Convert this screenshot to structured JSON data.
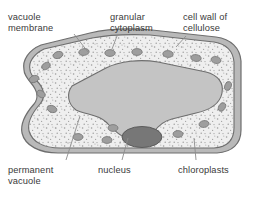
{
  "figure": {
    "width": 255,
    "height": 197,
    "background_color": "#ffffff"
  },
  "labels": {
    "vacuole_membrane": "vacuole\nmembrane",
    "granular_cytoplasm": "granular\ncytoplasm",
    "cell_wall_of_cellulose": "cell wall of\ncellulose",
    "permanent_vacuole": "permanent\nvacuole",
    "nucleus": "nucleus",
    "chloroplasts": "chloroplasts"
  },
  "colors": {
    "text": "#3a3a3a",
    "leader_line": "#8c8c8c",
    "cell_wall_outer_stroke": "#6e6e6e",
    "cell_wall_fill": "#b9b9b9",
    "cell_membrane_stroke": "#6e6e6e",
    "cytoplasm_fill": "#efefef",
    "cytoplasm_speckle": "#9a9a9a",
    "vacuole_fill": "#c4c4c4",
    "vacuole_stroke": "#6e6e6e",
    "chloroplast_fill": "#9e9e9e",
    "chloroplast_stroke": "#767676",
    "nucleus_fill": "#777777",
    "nucleus_stroke": "#5c5c5c"
  },
  "structures": {
    "cell_wall": {
      "name": "cell wall of cellulose",
      "description": "outer double-lined boundary of the cell"
    },
    "cytoplasm": {
      "name": "granular cytoplasm",
      "description": "speckled region between cell wall and vacuole"
    },
    "vacuole": {
      "name": "permanent vacuole",
      "description": "large pale grey central region"
    },
    "nucleus": {
      "name": "nucleus",
      "description": "dark grey ellipse at lower centre",
      "cx": 142,
      "cy": 137,
      "rx": 20,
      "ry": 10.5
    },
    "chloroplasts": {
      "name": "chloroplasts",
      "count": 18,
      "description": "small grey ovals scattered in the cytoplasm",
      "positions": [
        {
          "cx": 58,
          "cy": 55,
          "rx": 5.0,
          "ry": 3.4,
          "rot": -18
        },
        {
          "cx": 84,
          "cy": 52,
          "rx": 5.2,
          "ry": 3.4,
          "rot": -8
        },
        {
          "cx": 110,
          "cy": 53,
          "rx": 5.2,
          "ry": 3.4,
          "rot": 0
        },
        {
          "cx": 137,
          "cy": 52,
          "rx": 5.2,
          "ry": 3.4,
          "rot": 0
        },
        {
          "cx": 168,
          "cy": 54,
          "rx": 5.2,
          "ry": 3.4,
          "rot": 4
        },
        {
          "cx": 196,
          "cy": 58,
          "rx": 5.2,
          "ry": 3.4,
          "rot": 8
        },
        {
          "cx": 216,
          "cy": 60,
          "rx": 5.0,
          "ry": 3.4,
          "rot": 12
        },
        {
          "cx": 46,
          "cy": 66,
          "rx": 4.6,
          "ry": 3.2,
          "rot": -30
        },
        {
          "cx": 34,
          "cy": 79,
          "rx": 5.0,
          "ry": 3.4,
          "rot": -22
        },
        {
          "cx": 41,
          "cy": 94,
          "rx": 4.6,
          "ry": 3.2,
          "rot": 30
        },
        {
          "cx": 52,
          "cy": 109,
          "rx": 5.0,
          "ry": 3.4,
          "rot": 20
        },
        {
          "cx": 228,
          "cy": 86,
          "rx": 4.6,
          "ry": 3.2,
          "rot": -70
        },
        {
          "cx": 222,
          "cy": 107,
          "rx": 4.6,
          "ry": 3.2,
          "rot": -60
        },
        {
          "cx": 204,
          "cy": 124,
          "rx": 5.0,
          "ry": 3.4,
          "rot": -10
        },
        {
          "cx": 178,
          "cy": 134,
          "rx": 5.0,
          "ry": 3.4,
          "rot": 0
        },
        {
          "cx": 113,
          "cy": 128,
          "rx": 5.0,
          "ry": 3.4,
          "rot": 0
        },
        {
          "cx": 107,
          "cy": 140,
          "rx": 5.0,
          "ry": 3.4,
          "rot": 0
        },
        {
          "cx": 78,
          "cy": 137,
          "rx": 5.0,
          "ry": 3.4,
          "rot": 0
        }
      ]
    }
  },
  "leader_lines": {
    "vacuole_membrane": {
      "x1": 74,
      "y1": 34,
      "x2": 88,
      "y2": 52
    },
    "granular_cytoplasm": {
      "x1": 117,
      "y1": 36,
      "x2": 112,
      "y2": 49
    },
    "cell_wall_of_cellulose": {
      "x1": 186,
      "y1": 36,
      "x2": 176,
      "y2": 47
    },
    "permanent_vacuole": {
      "x1": 66,
      "y1": 160,
      "x2": 80,
      "y2": 116
    },
    "nucleus": {
      "x1": 122,
      "y1": 160,
      "x2": 128,
      "y2": 138
    },
    "chloroplasts": {
      "x1": 196,
      "y1": 160,
      "x2": 194,
      "y2": 138
    }
  }
}
